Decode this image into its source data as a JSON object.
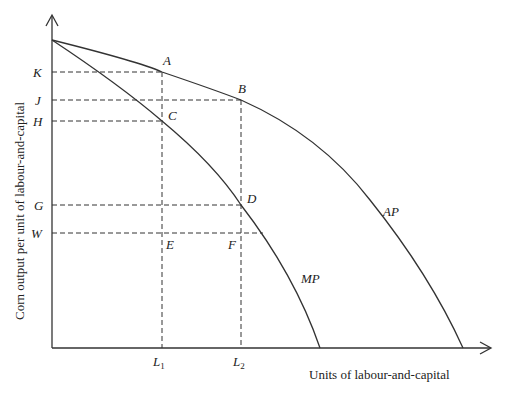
{
  "diagram": {
    "x_axis_label": "Units of labour-and-capital",
    "y_axis_label": "Corn output per unit of labour-and-capital",
    "curves": [
      {
        "name": "AP",
        "label": "AP"
      },
      {
        "name": "MP",
        "label": "MP"
      }
    ],
    "points": {
      "A": "A",
      "B": "B",
      "C": "C",
      "D": "D",
      "E": "E",
      "F": "F"
    },
    "y_ticks": {
      "K": "K",
      "J": "J",
      "H": "H",
      "G": "G",
      "W": "W"
    },
    "x_ticks": {
      "L1_base": "L",
      "L1_sub": "1",
      "L2_base": "L",
      "L2_sub": "2"
    },
    "colors": {
      "line": "#333333",
      "background": "#ffffff"
    }
  }
}
